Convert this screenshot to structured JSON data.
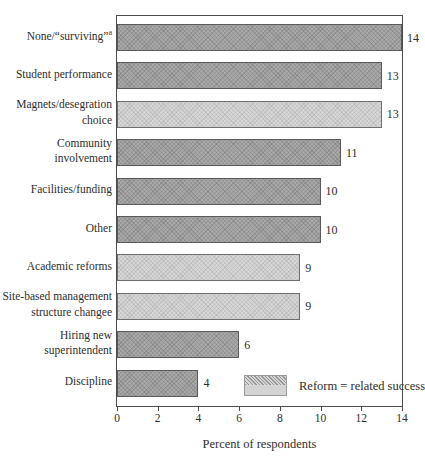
{
  "chart_data": {
    "type": "bar",
    "orientation": "horizontal",
    "title": "",
    "xlabel": "Percent of respondents",
    "ylabel": "",
    "xlim": [
      0,
      14
    ],
    "xticks": [
      0,
      2,
      4,
      6,
      8,
      10,
      12,
      14
    ],
    "grid": false,
    "legend_position": "bottom-right-inside",
    "bars": [
      {
        "label": "None/“surviving”",
        "sup": "a",
        "value": 14,
        "reform_related": false
      },
      {
        "label": "Student performance",
        "value": 13,
        "reform_related": false
      },
      {
        "label": "Magnets/desegration choice",
        "value": 13,
        "reform_related": true
      },
      {
        "label": "Community involvement",
        "value": 11,
        "reform_related": false
      },
      {
        "label": "Facilities/funding",
        "value": 10,
        "reform_related": false
      },
      {
        "label": "Other",
        "value": 10,
        "reform_related": false
      },
      {
        "label": "Academic reforms",
        "value": 9,
        "reform_related": true
      },
      {
        "label": "Site-based management structure changee",
        "value": 9,
        "reform_related": true
      },
      {
        "label": "Hiring new superintendent",
        "value": 6,
        "reform_related": false
      },
      {
        "label": "Discipline",
        "value": 4,
        "reform_related": false
      }
    ],
    "legend": {
      "label": "Reform = related success"
    },
    "colors": {
      "dark_bar": "#a8a8a8",
      "light_bar": "#d6d6d6",
      "bar_border": "#5a5a5a",
      "plot_border": "#4d4d4d",
      "text": "#2e2e2e",
      "background": "#ffffff"
    }
  }
}
